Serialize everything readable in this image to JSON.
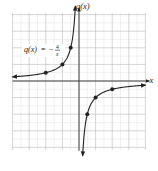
{
  "chart_data": {
    "type": "line",
    "title": "",
    "function_label": "q(x) = −4/x",
    "function_label_parts": {
      "lhs": "q(x)",
      "equals": "=",
      "sign": "−",
      "numerator": "4",
      "denominator": "x"
    },
    "xlabel": "x",
    "ylabel": "q(x)",
    "xlim": [
      -8,
      8
    ],
    "ylim": [
      -8.3,
      8.2
    ],
    "grid": true,
    "grid_step": 1,
    "legend": "none",
    "series": [
      {
        "name": "q(x) = -4/x (left branch)",
        "points": [
          {
            "x": -4,
            "y": 1
          },
          {
            "x": -2,
            "y": 2
          },
          {
            "x": -1,
            "y": 4
          }
        ],
        "curve_domain": [
          -8,
          -0.5
        ]
      },
      {
        "name": "q(x) = -4/x (right branch)",
        "points": [
          {
            "x": 1,
            "y": -4
          },
          {
            "x": 2,
            "y": -2
          },
          {
            "x": 4,
            "y": -1
          }
        ],
        "curve_domain": [
          0.5,
          8
        ]
      }
    ],
    "asymptotes": {
      "vertical": 0,
      "horizontal": 0
    }
  },
  "colors": {
    "curve": "#222222",
    "axis": "#333333",
    "grid_major": "#b8b8b8",
    "grid_minor": "#d2d2d2",
    "background": "#ffffff"
  }
}
